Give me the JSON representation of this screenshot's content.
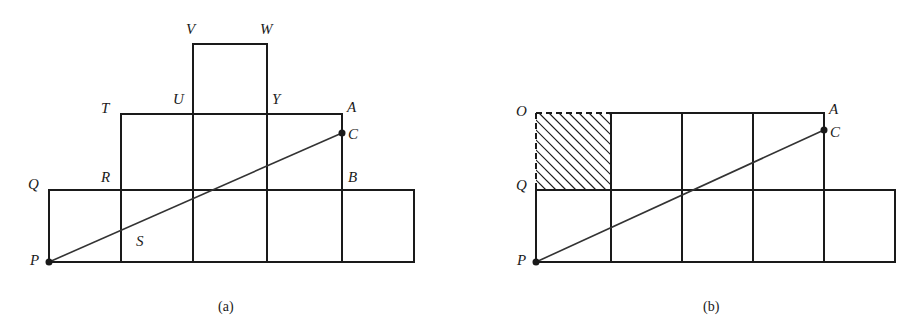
{
  "figure_a": {
    "caption": "(a)",
    "labels": {
      "P": "P",
      "Q": "Q",
      "R": "R",
      "S": "S",
      "T": "T",
      "U": "U",
      "V": "V",
      "W": "W",
      "Y": "Y",
      "A": "A",
      "B": "B",
      "C": "C"
    },
    "description": "Pyramid of unit squares: 5 on bottom row, 3 in middle row, 1 on top; segment from P to C"
  },
  "figure_b": {
    "caption": "(b)",
    "labels": {
      "O": "O",
      "Q": "Q",
      "P": "P",
      "A": "A",
      "C": "C"
    },
    "description": "Rearranged squares: 5 on bottom row, 4 on top row with hatched square OQ; segment from P to C"
  }
}
